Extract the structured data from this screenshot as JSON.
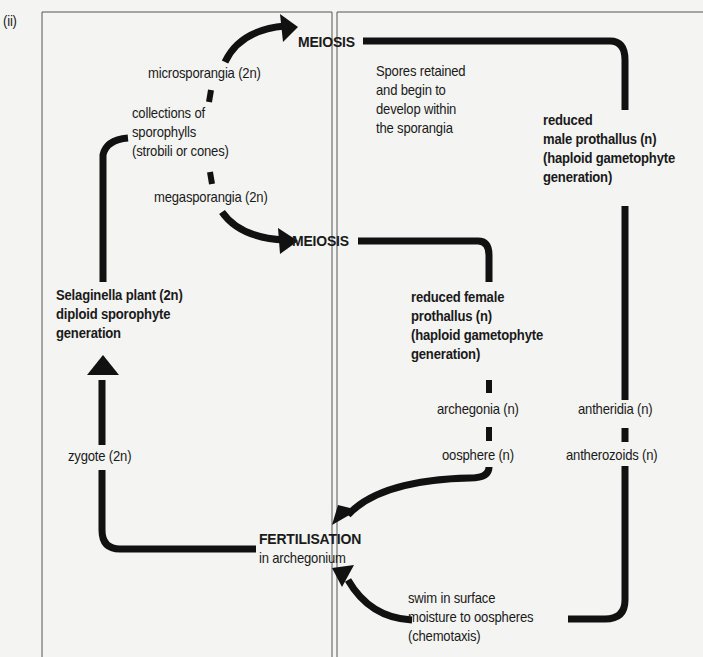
{
  "figure": {
    "panel_label": "(ii)",
    "colors": {
      "ink": "#111111",
      "paper": "#f4f4f2",
      "frame": "#444444"
    }
  },
  "nodes": {
    "meiosis_top": "MEIOSIS",
    "meiosis_mid": "MEIOSIS",
    "microsporangia": "microsporangia (2n)",
    "collections": [
      "collections of",
      "sporophylls",
      "(strobili or cones)"
    ],
    "megasporangia": "megasporangia (2n)",
    "spores_retained": [
      "Spores retained",
      "and begin to",
      "develop within",
      "the sporangia"
    ],
    "male_prothallus": [
      "reduced",
      "male prothallus (n)",
      "(haploid gametophyte",
      "generation)"
    ],
    "selaginella": [
      "Selaginella plant (2n)",
      "diploid sporophyte",
      "generation"
    ],
    "female_prothallus": [
      "reduced female",
      "prothallus (n)",
      "(haploid gametophyte",
      "generation)"
    ],
    "archegonia": "archegonia (n)",
    "oosphere": "oosphere (n)",
    "antheridia": "antheridia (n)",
    "antherozoids": "antherozoids (n)",
    "zygote": "zygote (2n)",
    "fertilisation": "FERTILISATION",
    "in_archegonium": "in archegonium",
    "swim": [
      "swim in surface",
      "moisture to oospheres",
      "(chemotaxis)"
    ]
  }
}
